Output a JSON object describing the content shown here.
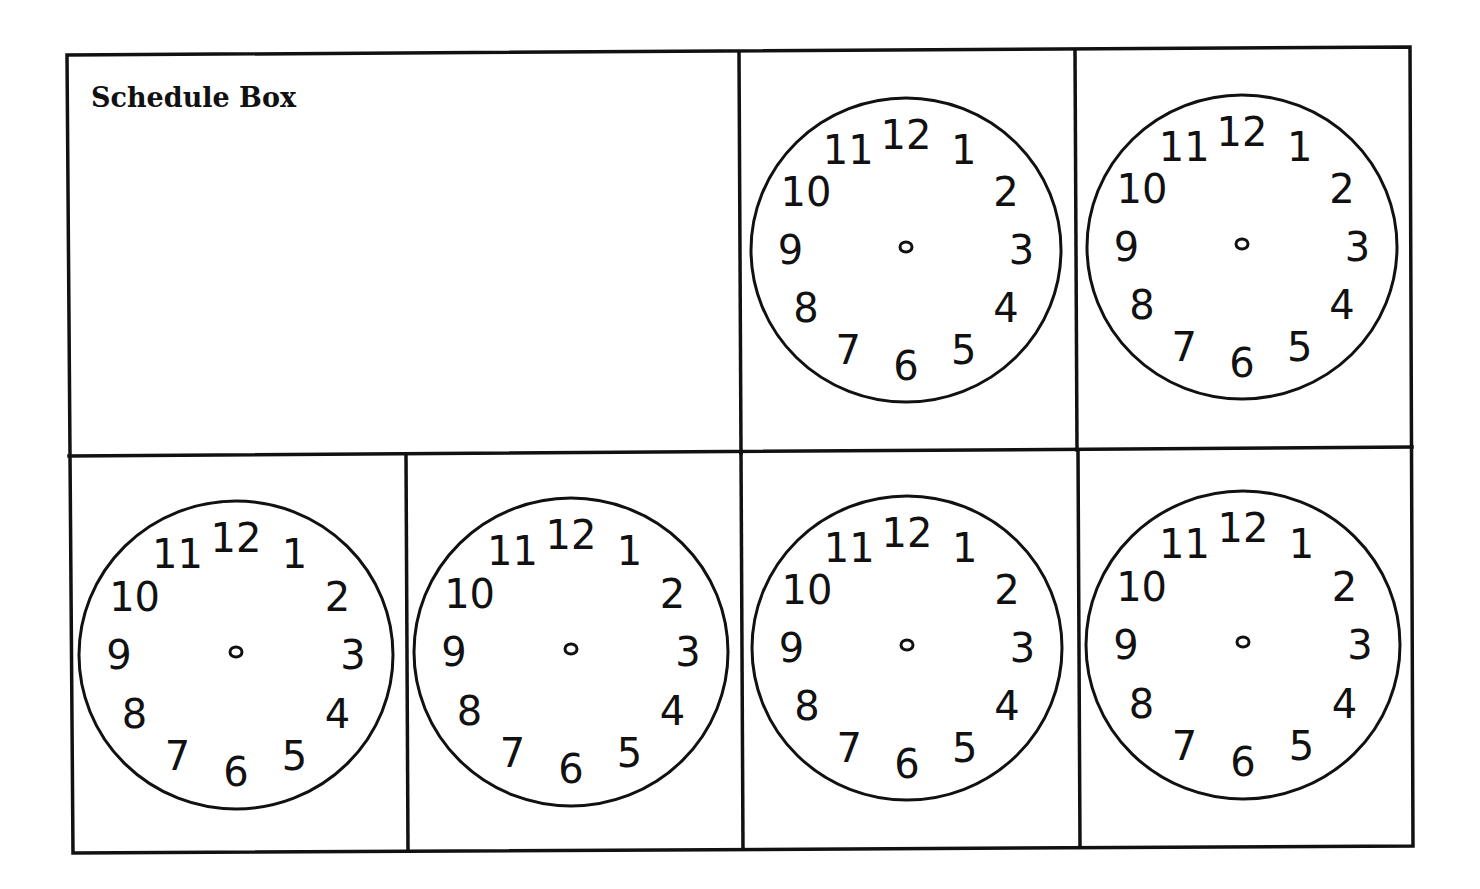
{
  "worksheet": {
    "title": "Schedule Box",
    "clock_numbers": [
      "12",
      "1",
      "2",
      "3",
      "4",
      "5",
      "6",
      "7",
      "8",
      "9",
      "10",
      "11"
    ],
    "clock_count": 6,
    "colors": {
      "ink": "#111111",
      "paper": "#ffffff"
    }
  }
}
